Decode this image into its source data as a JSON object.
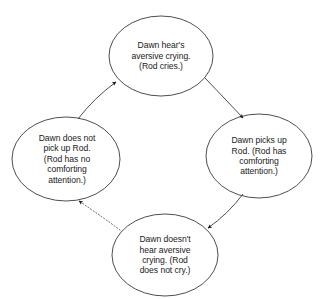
{
  "diagram": {
    "type": "cycle-diagram",
    "background_color": "#ffffff",
    "stroke_color": "#3a3a3a",
    "text_color": "#1a1a1a",
    "nodes": [
      {
        "id": "top",
        "position": "top",
        "text": "Dawn hear's\naversive crying.\n(Rod cries.)",
        "shape": "ellipse",
        "cx": 161,
        "cy": 56,
        "rx": 52,
        "ry": 40
      },
      {
        "id": "right",
        "position": "right",
        "text": "Dawn picks up\nRod. (Rod has\ncomforting\nattention.)",
        "shape": "ellipse",
        "cx": 259,
        "cy": 156,
        "rx": 53,
        "ry": 42
      },
      {
        "id": "bottom",
        "position": "bottom",
        "text": "Dawn doesn't\nhear aversive\ncrying. (Rod\ndoes not cry.)",
        "shape": "ellipse",
        "cx": 165,
        "cy": 255,
        "rx": 53,
        "ry": 41
      },
      {
        "id": "left",
        "position": "left",
        "text": "Dawn does not\npick up Rod.\n(Rod has no\ncomforting\nattention.)",
        "shape": "ellipse",
        "cx": 66,
        "cy": 159,
        "rx": 54,
        "ry": 42
      }
    ],
    "edges": [
      {
        "id": "top-to-right",
        "from": "top",
        "to": "right",
        "style": "solid",
        "arrowhead": "filled",
        "direction": "clockwise"
      },
      {
        "id": "right-to-bottom",
        "from": "right",
        "to": "bottom",
        "style": "solid",
        "arrowhead": "filled",
        "direction": "clockwise"
      },
      {
        "id": "bottom-to-left",
        "from": "bottom",
        "to": "left",
        "style": "dotted",
        "arrowhead": "filled",
        "direction": "clockwise"
      },
      {
        "id": "left-to-top",
        "from": "left",
        "to": "top",
        "style": "solid",
        "arrowhead": "filled",
        "direction": "clockwise"
      }
    ]
  }
}
